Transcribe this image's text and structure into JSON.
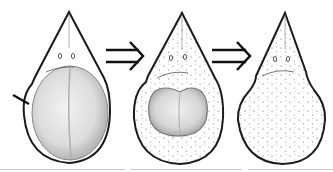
{
  "diagram": {
    "stages": [
      {
        "id": "stage-1",
        "label": "",
        "inner": "large-oval-body",
        "marker": "arrow-pointer"
      },
      {
        "id": "stage-2",
        "label": "",
        "inner": "bilobed-shrunken-body",
        "marker": ""
      },
      {
        "id": "stage-3",
        "label": "",
        "inner": "none-stippled",
        "marker": ""
      }
    ],
    "connectors": [
      {
        "from": "stage-1",
        "to": "stage-2",
        "glyph": "⇒"
      },
      {
        "from": "stage-2",
        "to": "stage-3",
        "glyph": "⇒"
      }
    ],
    "colors": {
      "outline": "#1a1a1a",
      "inner_fill": "#d9d9d9",
      "inner_shade": "#a8a8a8",
      "stipple": "#555555",
      "baseline": "#c8c8c8"
    }
  }
}
